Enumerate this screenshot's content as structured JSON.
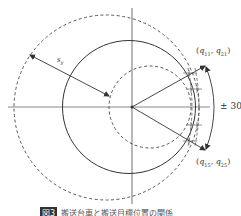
{
  "diagram": {
    "labels": {
      "point_top": "(q11, q21)",
      "point_top_parts": {
        "open": "(",
        "q1": "q",
        "q1_sub": "11",
        "sep": ", ",
        "q2": "q",
        "q2_sub": "21",
        "close": ")"
      },
      "point_bottom": "(q15, q25)",
      "point_bottom_parts": {
        "open": "(",
        "q1": "q",
        "q1_sub": "15",
        "sep": ", ",
        "q2": "q",
        "q2_sub": "25",
        "close": ")"
      },
      "angle": "± 30°",
      "distance": "s",
      "distance_sub": "y"
    },
    "caption": {
      "figure_label": "図3",
      "text": "搬送台車と搬送目標位置の関係"
    },
    "colors": {
      "line": "#333333",
      "axis": "#888888",
      "background": "#ffffff"
    }
  }
}
